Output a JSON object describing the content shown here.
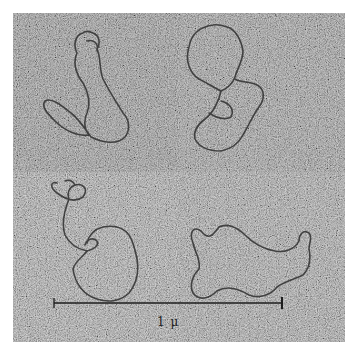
{
  "figure": {
    "panels": [
      {
        "position": "top-left",
        "content": "circular-dna-molecule"
      },
      {
        "position": "top-right",
        "content": "circular-dna-molecule"
      },
      {
        "position": "bottom-left",
        "content": "circular-dna-molecule"
      },
      {
        "position": "bottom-right",
        "content": "circular-dna-molecule"
      }
    ],
    "scale_bar": {
      "label": "1 μ"
    },
    "colors": {
      "background": "#ffffff",
      "strand": "#2a2a2a",
      "grain_dark": "#5a5a5a",
      "grain_light": "#d8d8d8"
    }
  }
}
